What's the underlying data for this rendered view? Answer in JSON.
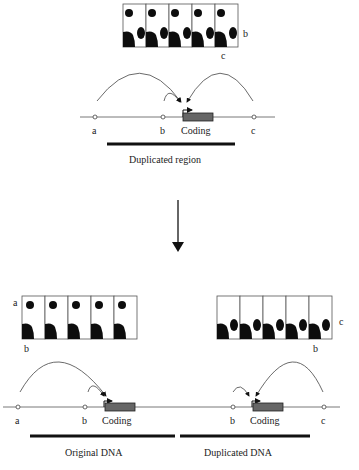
{
  "top": {
    "cell_strip": {
      "cells": 5,
      "labels": {
        "right": "b",
        "below": "c"
      }
    },
    "dna": {
      "sites": [
        "a",
        "b",
        "c"
      ],
      "gene_label": "Coding",
      "bar_label": "Duplicated region"
    }
  },
  "transition_arrow": "down-arrow",
  "bottom_left": {
    "cell_strip": {
      "cells": 5,
      "labels": {
        "left": "a",
        "below": "b"
      }
    },
    "dna": {
      "sites": [
        "a",
        "b"
      ],
      "gene_label": "Coding",
      "bar_label": "Original DNA"
    }
  },
  "bottom_right": {
    "cell_strip": {
      "cells": 5,
      "labels": {
        "right": "c",
        "below": "b"
      }
    },
    "dna": {
      "sites": [
        "b",
        "c"
      ],
      "gene_label": "Coding",
      "bar_label": "Duplicated DNA"
    }
  },
  "colors": {
    "blob": "#0d0d0d",
    "coding": "#666666",
    "line": "#555555"
  }
}
